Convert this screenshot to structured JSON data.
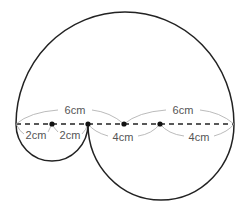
{
  "diagram": {
    "colors": {
      "outline": "#222222",
      "dimension_lines": "#aaaaaa",
      "labels": "#555555"
    },
    "points": [
      "left-end",
      "center-small",
      "junction",
      "center-large",
      "center-medium",
      "right-end"
    ],
    "labels": {
      "top_left_6": "6cm",
      "top_right_6": "6cm",
      "seg_2a": "2cm",
      "seg_2b": "2cm",
      "seg_4a": "4cm",
      "seg_4b": "4cm"
    },
    "shapes": [
      {
        "name": "large-semicircle",
        "position": "above baseline",
        "radius": "6cm"
      },
      {
        "name": "small-semicircle",
        "position": "below baseline",
        "radius": "2cm"
      },
      {
        "name": "medium-semicircle",
        "position": "below baseline",
        "radius": "4cm"
      }
    ]
  }
}
